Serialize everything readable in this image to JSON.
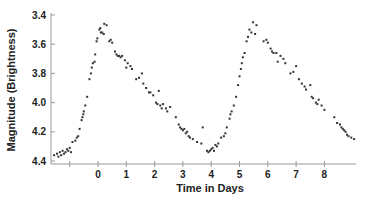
{
  "chart_data": {
    "type": "scatter",
    "title": "",
    "xlabel": "Time in Days",
    "ylabel": "Magnitude (Brightness)",
    "x_ticks": [
      "",
      "0",
      "1",
      "2",
      "3",
      "4",
      "5",
      "6",
      "7",
      "8"
    ],
    "x_tick_values": [
      -1,
      0,
      1,
      2,
      3,
      4,
      5,
      6,
      7,
      8
    ],
    "y_ticks": [
      "3.4",
      "3.6",
      "3.8",
      "4.0",
      "4.2",
      "4.4"
    ],
    "y_tick_values": [
      3.4,
      3.6,
      3.8,
      4.0,
      4.2,
      4.4
    ],
    "xlim": [
      -1.7,
      9.1
    ],
    "ylim": [
      3.4,
      4.4
    ],
    "y_inverted": true,
    "grid": false,
    "legend": null,
    "series": [
      {
        "name": "Variable star light curve",
        "points": [
          [
            -1.55,
            4.36
          ],
          [
            -1.45,
            4.35
          ],
          [
            -1.4,
            4.37
          ],
          [
            -1.35,
            4.34
          ],
          [
            -1.3,
            4.36
          ],
          [
            -1.25,
            4.33
          ],
          [
            -1.2,
            4.35
          ],
          [
            -1.15,
            4.34
          ],
          [
            -1.1,
            4.32
          ],
          [
            -1.05,
            4.33
          ],
          [
            -1.0,
            4.31
          ],
          [
            -0.95,
            4.34
          ],
          [
            -0.9,
            4.27
          ],
          [
            -0.8,
            4.26
          ],
          [
            -0.75,
            4.24
          ],
          [
            -0.7,
            4.23
          ],
          [
            -0.65,
            4.18
          ],
          [
            -0.58,
            4.12
          ],
          [
            -0.55,
            4.1
          ],
          [
            -0.52,
            4.08
          ],
          [
            -0.5,
            4.06
          ],
          [
            -0.45,
            4.02
          ],
          [
            -0.38,
            3.96
          ],
          [
            -0.3,
            3.84
          ],
          [
            -0.25,
            3.8
          ],
          [
            -0.22,
            3.76
          ],
          [
            -0.18,
            3.73
          ],
          [
            -0.12,
            3.72
          ],
          [
            -0.1,
            3.67
          ],
          [
            -0.05,
            3.58
          ],
          [
            -0.02,
            3.56
          ],
          [
            0.05,
            3.5
          ],
          [
            0.08,
            3.49
          ],
          [
            0.1,
            3.52
          ],
          [
            0.15,
            3.52
          ],
          [
            0.2,
            3.53
          ],
          [
            0.22,
            3.46
          ],
          [
            0.3,
            3.47
          ],
          [
            0.4,
            3.58
          ],
          [
            0.45,
            3.57
          ],
          [
            0.5,
            3.59
          ],
          [
            0.6,
            3.65
          ],
          [
            0.65,
            3.67
          ],
          [
            0.7,
            3.68
          ],
          [
            0.75,
            3.68
          ],
          [
            0.8,
            3.69
          ],
          [
            0.85,
            3.68
          ],
          [
            0.95,
            3.71
          ],
          [
            1.0,
            3.76
          ],
          [
            1.05,
            3.73
          ],
          [
            1.15,
            3.75
          ],
          [
            1.2,
            3.77
          ],
          [
            1.35,
            3.84
          ],
          [
            1.45,
            3.83
          ],
          [
            1.55,
            3.8
          ],
          [
            1.6,
            3.87
          ],
          [
            1.7,
            3.9
          ],
          [
            1.8,
            3.93
          ],
          [
            1.85,
            3.93
          ],
          [
            1.95,
            3.95
          ],
          [
            2.05,
            4.0
          ],
          [
            2.1,
            4.01
          ],
          [
            2.15,
            3.92
          ],
          [
            2.2,
            4.02
          ],
          [
            2.25,
            4.04
          ],
          [
            2.3,
            4.01
          ],
          [
            2.4,
            4.04
          ],
          [
            2.45,
            4.06
          ],
          [
            2.55,
            4.03
          ],
          [
            2.75,
            4.1
          ],
          [
            2.85,
            4.15
          ],
          [
            2.9,
            4.17
          ],
          [
            2.95,
            4.18
          ],
          [
            3.0,
            4.19
          ],
          [
            3.05,
            4.18
          ],
          [
            3.1,
            4.21
          ],
          [
            3.15,
            4.2
          ],
          [
            3.2,
            4.23
          ],
          [
            3.25,
            4.24
          ],
          [
            3.35,
            4.25
          ],
          [
            3.5,
            4.27
          ],
          [
            3.65,
            4.28
          ],
          [
            3.7,
            4.17
          ],
          [
            3.85,
            4.33
          ],
          [
            3.9,
            4.34
          ],
          [
            3.95,
            4.33
          ],
          [
            4.0,
            4.32
          ],
          [
            4.05,
            4.31
          ],
          [
            4.1,
            4.33
          ],
          [
            4.15,
            4.29
          ],
          [
            4.2,
            4.3
          ],
          [
            4.25,
            4.28
          ],
          [
            4.35,
            4.24
          ],
          [
            4.45,
            4.23
          ],
          [
            4.5,
            4.21
          ],
          [
            4.55,
            4.17
          ],
          [
            4.65,
            4.11
          ],
          [
            4.68,
            4.08
          ],
          [
            4.72,
            4.06
          ],
          [
            4.8,
            4.02
          ],
          [
            4.88,
            3.96
          ],
          [
            4.95,
            3.88
          ],
          [
            5.0,
            3.82
          ],
          [
            5.05,
            3.77
          ],
          [
            5.08,
            3.73
          ],
          [
            5.12,
            3.69
          ],
          [
            5.18,
            3.66
          ],
          [
            5.25,
            3.58
          ],
          [
            5.3,
            3.55
          ],
          [
            5.35,
            3.5
          ],
          [
            5.42,
            3.52
          ],
          [
            5.48,
            3.45
          ],
          [
            5.55,
            3.53
          ],
          [
            5.6,
            3.47
          ],
          [
            5.85,
            3.58
          ],
          [
            5.95,
            3.57
          ],
          [
            6.0,
            3.59
          ],
          [
            6.1,
            3.63
          ],
          [
            6.15,
            3.65
          ],
          [
            6.2,
            3.66
          ],
          [
            6.3,
            3.66
          ],
          [
            6.35,
            3.72
          ],
          [
            6.45,
            3.68
          ],
          [
            6.55,
            3.7
          ],
          [
            6.62,
            3.73
          ],
          [
            6.8,
            3.8
          ],
          [
            6.9,
            3.79
          ],
          [
            7.0,
            3.75
          ],
          [
            7.1,
            3.84
          ],
          [
            7.2,
            3.87
          ],
          [
            7.3,
            3.89
          ],
          [
            7.35,
            3.91
          ],
          [
            7.5,
            3.88
          ],
          [
            7.55,
            3.96
          ],
          [
            7.6,
            3.97
          ],
          [
            7.7,
            4.0
          ],
          [
            7.75,
            4.01
          ],
          [
            7.8,
            3.98
          ],
          [
            7.9,
            4.02
          ],
          [
            8.0,
            4.05
          ],
          [
            8.35,
            4.1
          ],
          [
            8.45,
            4.14
          ],
          [
            8.55,
            4.15
          ],
          [
            8.6,
            4.17
          ],
          [
            8.65,
            4.18
          ],
          [
            8.7,
            4.19
          ],
          [
            8.75,
            4.2
          ],
          [
            8.8,
            4.22
          ],
          [
            8.85,
            4.23
          ],
          [
            8.95,
            4.24
          ],
          [
            9.05,
            4.25
          ]
        ]
      }
    ]
  }
}
